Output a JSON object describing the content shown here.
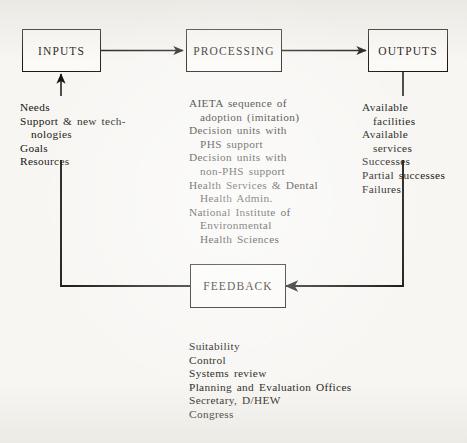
{
  "diagram": {
    "background_color": "#f7f6f3",
    "ink_color": "#16140f",
    "nodes": {
      "inputs": {
        "label": "INPUTS"
      },
      "processing": {
        "label": "PROCESSING"
      },
      "outputs": {
        "label": "OUTPUTS"
      },
      "feedback": {
        "label": "FEEDBACK"
      }
    },
    "inputs_list": {
      "lines": [
        "Needs",
        "Support & new tech-",
        "nologies",
        "Goals",
        "Resources"
      ]
    },
    "processing_list": {
      "lines": [
        "AIETA sequence of",
        "adoption (imitation)",
        "Decision units with",
        "PHS support",
        "Decision units with",
        "non-PHS support",
        "Health Services & Dental",
        "Health Admin.",
        "National Institute of",
        "Environmental",
        "Health Sciences"
      ]
    },
    "outputs_list": {
      "lines": [
        "Available",
        "facilities",
        "Available",
        "services",
        "Successes",
        "Partial successes",
        "Failures"
      ]
    },
    "feedback_list": {
      "lines": [
        "Suitability",
        "Control",
        "Systems review",
        "Planning and Evaluation Offices",
        "Secretary, D/HEW",
        "Congress"
      ]
    }
  }
}
